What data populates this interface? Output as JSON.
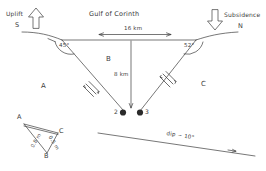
{
  "figure": {
    "kind": "geological-cross-section",
    "title": "Gulf of Corinth",
    "ink_color": "#3c3c3c",
    "canvas": {
      "width": 266,
      "height": 171
    }
  },
  "annotations": {
    "uplift_label": "Uplift",
    "uplift_direction": "S",
    "uplift_arrow_icon": "arrow-up-outline",
    "subsidence_label": "Subsidence",
    "subsidence_direction": "N",
    "subsidence_arrow_icon": "arrow-down-outline",
    "basin_title": "Gulf of Corinth",
    "width_measure": "16 km",
    "width_arrow_icon": "double-headed-arrow-horizontal",
    "depth_measure": "8 km",
    "depth_arrow_icon": "arrow-down-line",
    "fault_angle_left": "45°",
    "fault_angle_right": "52°",
    "dip_label": "dip ~ 10°",
    "dip_arrow_icon": "arrow-right-small"
  },
  "blocks": [
    {
      "id": "A",
      "label": "A",
      "role": "footwall-south"
    },
    {
      "id": "B",
      "label": "B",
      "role": "graben-basin"
    },
    {
      "id": "C",
      "label": "C",
      "role": "hanging-wall-north"
    }
  ],
  "nodes": [
    {
      "label": "2",
      "icon": "filled-dot",
      "side": "left"
    },
    {
      "label": "3",
      "icon": "filled-dot",
      "side": "right"
    }
  ],
  "slip_markers": [
    {
      "on": "left-fault",
      "icon": "slip-hatch-arrows"
    },
    {
      "on": "right-fault",
      "icon": "slip-hatch-arrows"
    }
  ],
  "inset": {
    "name": "triangle-inset",
    "vertices": [
      {
        "label": "A"
      },
      {
        "label": "B"
      },
      {
        "label": "C"
      }
    ],
    "edges": [
      {
        "from": "A",
        "to": "B",
        "label": "0.8 m"
      },
      {
        "from": "B",
        "to": "C",
        "label": "0.5 m"
      }
    ]
  }
}
